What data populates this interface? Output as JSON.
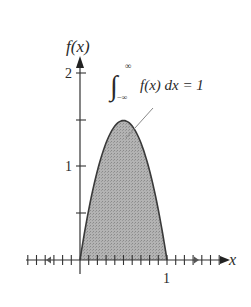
{
  "chart_data": {
    "type": "area",
    "title": "",
    "function": "f(x) = 6x(1 - x) on [0,1], 0 elsewhere",
    "xlabel": "x",
    "ylabel": "f(x)",
    "annotation": "∫_{-∞}^{∞} f(x) dx = 1",
    "x_tick_labels": [
      "1"
    ],
    "y_tick_labels": [
      "1",
      "2"
    ],
    "xlim": [
      -0.6,
      1.7
    ],
    "ylim": [
      0,
      2.2
    ],
    "x_ticks_minor_step": 0.1,
    "y_ticks": [
      0.5,
      1,
      1.5,
      2
    ],
    "grid": false,
    "legend": "none",
    "x": [
      0,
      0.1,
      0.2,
      0.3,
      0.4,
      0.5,
      0.6,
      0.7,
      0.8,
      0.9,
      1.0
    ],
    "values": [
      0,
      0.54,
      0.96,
      1.26,
      1.44,
      1.5,
      1.44,
      1.26,
      0.96,
      0.54,
      0
    ],
    "fill_color": "#a9a9a9",
    "line_color": "#3a3a3a"
  },
  "labels": {
    "y_axis": "f(x)",
    "x_axis": "x",
    "y_two": "2",
    "y_one": "1",
    "x_one": "1",
    "integral_sup": "∞",
    "integral_sub": "−∞",
    "integral_body": "f(x) dx = 1"
  }
}
